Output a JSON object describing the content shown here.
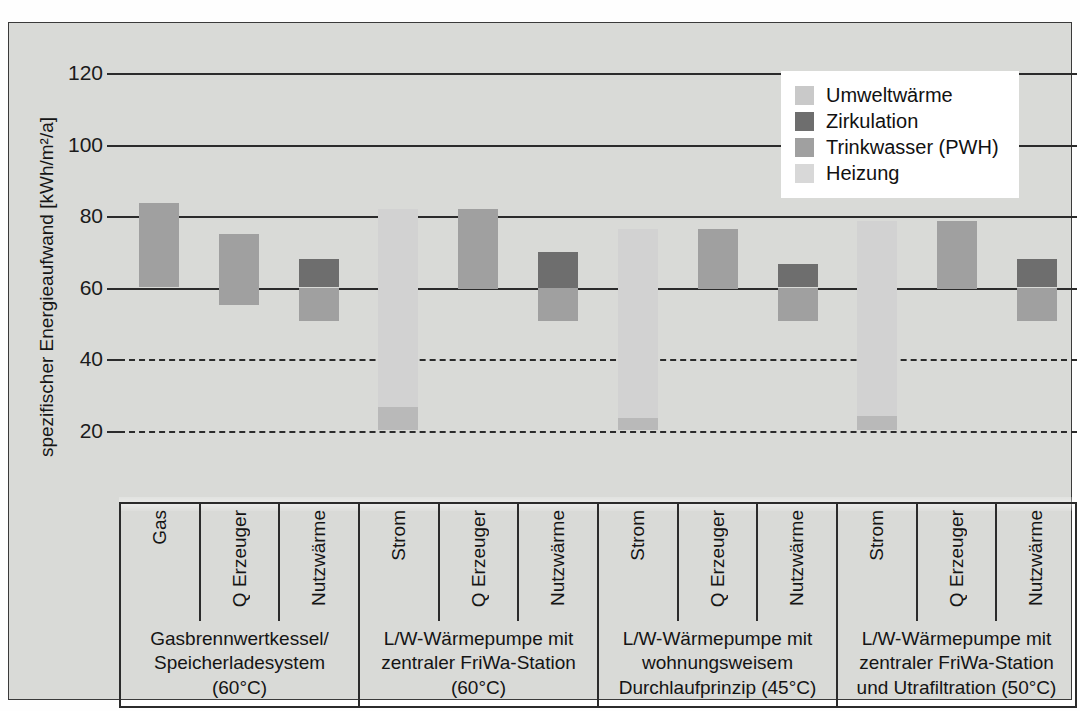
{
  "chart_data": {
    "type": "bar",
    "title": "",
    "xlabel": "",
    "ylabel": "spezifischer Energieaufwand [kWh/m2/a]",
    "ylabel_display": "spezifischer Energieaufwand [kWh/m²/a]",
    "ylim": [
      0,
      120
    ],
    "yticks": [
      0,
      20,
      40,
      60,
      80,
      100,
      120
    ],
    "ytick_labels": [
      "0",
      "20",
      "40",
      "60",
      "80",
      "100",
      "120"
    ],
    "grid": true,
    "grid_note": "solid gridlines at 60, 80, 100, 120; dashed gridlines at 20, 40",
    "legend": {
      "position": "top-right",
      "entries": [
        {
          "label": "Umweltwärme",
          "color": "#c9c9c9"
        },
        {
          "label": "Zirkulation",
          "color": "#6e6e6e"
        },
        {
          "label": "Trinkwasser (PWH)",
          "color": "#a0a0a0"
        },
        {
          "label": "Heizung",
          "color": "#d8d8d8"
        }
      ]
    },
    "categories": [
      "Gas",
      "Q Erzeuger",
      "Nutzwärme",
      "Strom",
      "Q Erzeuger",
      "Nutzwärme",
      "Strom",
      "Q Erzeuger",
      "Nutzwärme",
      "Strom",
      "Q Erzeuger",
      "Nutzwärme"
    ],
    "groups": [
      {
        "label": "Gasbrennwertkessel/\nSpeicherladesystem (60°C)",
        "span": 3
      },
      {
        "label": "L/W-Wärmepumpe mit\nzentraler FriWa-Station\n(60°C)",
        "span": 3
      },
      {
        "label": "L/W-Wärmepumpe mit\nwohnungsweisem\nDurchlaufprinzip (45°C)",
        "span": 3
      },
      {
        "label": "L/W-Wärmepumpe mit\nzentraler FriWa-Station\nund Utrafiltration (50°C)",
        "span": 3
      }
    ],
    "bars": [
      {
        "index": 0,
        "category": "Gas",
        "group": 0,
        "segments": [
          {
            "series": "Trinkwasser (PWH)",
            "from": 60.0,
            "to": 83.5,
            "color": "#a0a0a0"
          }
        ]
      },
      {
        "index": 1,
        "category": "Q Erzeuger",
        "group": 0,
        "segments": [
          {
            "series": "Trinkwasser (PWH)",
            "from": 55.0,
            "to": 75.0,
            "color": "#a0a0a0"
          }
        ]
      },
      {
        "index": 2,
        "category": "Nutzwärme",
        "group": 0,
        "segments": [
          {
            "series": "Trinkwasser (PWH)",
            "from": 50.5,
            "to": 60.0,
            "color": "#a0a0a0"
          },
          {
            "series": "Zirkulation",
            "from": 60.0,
            "to": 68.0,
            "color": "#6e6e6e"
          }
        ]
      },
      {
        "index": 3,
        "category": "Strom",
        "group": 1,
        "segments": [
          {
            "series": "Umweltwärme",
            "from": 20.0,
            "to": 26.5,
            "color": "#b9b9b9"
          },
          {
            "series": "Heizung",
            "from": 26.5,
            "to": 82.0,
            "color": "#d2d2d2"
          }
        ]
      },
      {
        "index": 4,
        "category": "Q Erzeuger",
        "group": 1,
        "segments": [
          {
            "series": "Trinkwasser (PWH)",
            "from": 59.5,
            "to": 82.0,
            "color": "#a0a0a0"
          }
        ]
      },
      {
        "index": 5,
        "category": "Nutzwärme",
        "group": 1,
        "segments": [
          {
            "series": "Trinkwasser (PWH)",
            "from": 50.5,
            "to": 60.0,
            "color": "#a0a0a0"
          },
          {
            "series": "Zirkulation",
            "from": 60.0,
            "to": 70.0,
            "color": "#6e6e6e"
          }
        ]
      },
      {
        "index": 6,
        "category": "Strom",
        "group": 2,
        "segments": [
          {
            "series": "Umweltwärme",
            "from": 20.0,
            "to": 23.5,
            "color": "#b9b9b9"
          },
          {
            "series": "Heizung",
            "from": 23.5,
            "to": 76.5,
            "color": "#d2d2d2"
          }
        ]
      },
      {
        "index": 7,
        "category": "Q Erzeuger",
        "group": 2,
        "segments": [
          {
            "series": "Trinkwasser (PWH)",
            "from": 59.5,
            "to": 76.5,
            "color": "#a0a0a0"
          }
        ]
      },
      {
        "index": 8,
        "category": "Nutzwärme",
        "group": 2,
        "segments": [
          {
            "series": "Trinkwasser (PWH)",
            "from": 50.5,
            "to": 60.0,
            "color": "#a0a0a0"
          },
          {
            "series": "Zirkulation",
            "from": 60.0,
            "to": 66.5,
            "color": "#6e6e6e"
          }
        ]
      },
      {
        "index": 9,
        "category": "Strom",
        "group": 3,
        "segments": [
          {
            "series": "Umweltwärme",
            "from": 20.0,
            "to": 24.0,
            "color": "#b9b9b9"
          },
          {
            "series": "Heizung",
            "from": 24.0,
            "to": 78.5,
            "color": "#d2d2d2"
          }
        ]
      },
      {
        "index": 10,
        "category": "Q Erzeuger",
        "group": 3,
        "segments": [
          {
            "series": "Trinkwasser (PWH)",
            "from": 59.5,
            "to": 78.5,
            "color": "#a0a0a0"
          }
        ]
      },
      {
        "index": 11,
        "category": "Nutzwärme",
        "group": 3,
        "segments": [
          {
            "series": "Trinkwasser (PWH)",
            "from": 50.5,
            "to": 60.0,
            "color": "#a0a0a0"
          },
          {
            "series": "Zirkulation",
            "from": 60.0,
            "to": 68.0,
            "color": "#6e6e6e"
          }
        ]
      }
    ]
  },
  "colors": {
    "background": "#d9dad7",
    "axis": "#2b2b2b",
    "text": "#141414",
    "umweltwaerme": "#c9c9c9",
    "zirkulation": "#6e6e6e",
    "trinkwasser": "#a0a0a0",
    "heizung": "#d8d8d8"
  }
}
